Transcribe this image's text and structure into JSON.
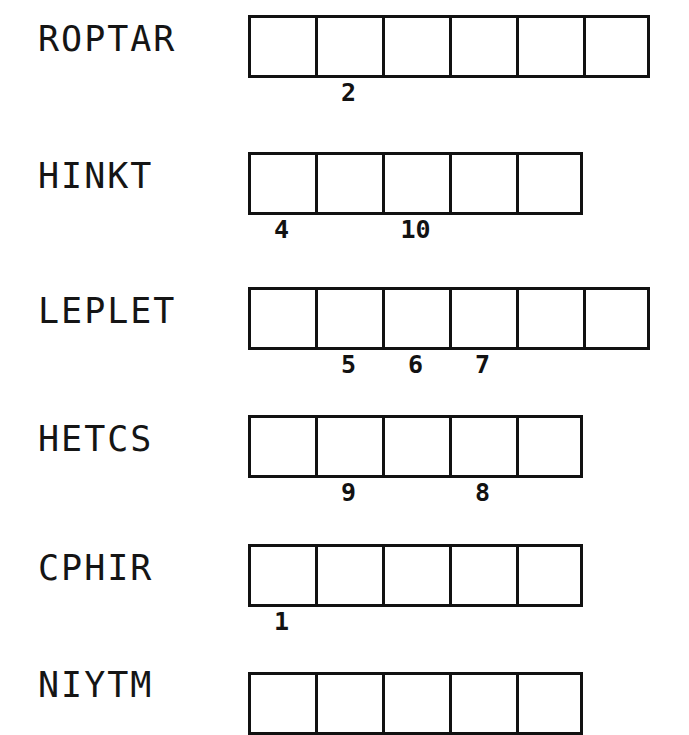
{
  "sheet": {
    "title": "Scrambled Word Puzzle Worksheet",
    "box_count_default": 5,
    "ink_color": "#111111",
    "paper_color": "#ffffff"
  },
  "rows": [
    {
      "word": "ROPTAR",
      "boxes": 6,
      "top": 15,
      "word_top": 22,
      "clues": [
        {
          "number": "2",
          "box_index": 1
        }
      ]
    },
    {
      "word": "HINKT",
      "boxes": 5,
      "top": 152,
      "word_top": 159,
      "clues": [
        {
          "number": "4",
          "box_index": 0
        },
        {
          "number": "10",
          "box_index": 2
        }
      ]
    },
    {
      "word": "LEPLET",
      "boxes": 6,
      "top": 287,
      "word_top": 294,
      "clues": [
        {
          "number": "5",
          "box_index": 1
        },
        {
          "number": "6",
          "box_index": 2
        },
        {
          "number": "7",
          "box_index": 3
        }
      ]
    },
    {
      "word": "HETCS",
      "boxes": 5,
      "top": 415,
      "word_top": 422,
      "clues": [
        {
          "number": "9",
          "box_index": 1
        },
        {
          "number": "8",
          "box_index": 3
        }
      ]
    },
    {
      "word": "CPHIR",
      "boxes": 5,
      "top": 544,
      "word_top": 551,
      "clues": [
        {
          "number": "1",
          "box_index": 0
        }
      ]
    },
    {
      "word": "NIYTM",
      "boxes": 5,
      "top": 672,
      "word_top": 668,
      "clues": []
    }
  ]
}
